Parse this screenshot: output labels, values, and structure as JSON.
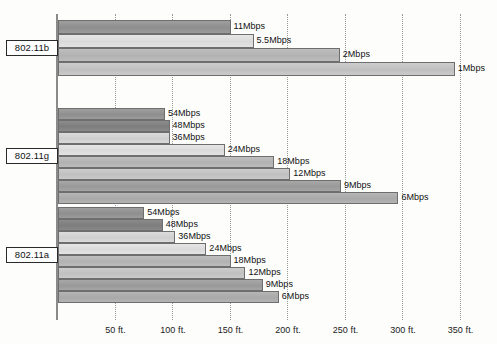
{
  "chart_data": {
    "type": "bar",
    "orientation": "horizontal",
    "title": "",
    "xlabel": "",
    "ylabel": "",
    "xlim": [
      0,
      370
    ],
    "x_unit": "ft.",
    "grid": "vertical-dotted",
    "legend": "none",
    "tick_labels": [
      "50 ft.",
      "100 ft.",
      "150 ft.",
      "200 ft.",
      "250 ft.",
      "300 ft.",
      "350 ft."
    ],
    "ticks": [
      50,
      100,
      150,
      200,
      250,
      300,
      350
    ],
    "groups": [
      {
        "name": "802.11b",
        "series": [
          {
            "label": "11Mbps",
            "value": 150,
            "shade": 0
          },
          {
            "label": "5.5Mbps",
            "value": 170,
            "shade": 3
          },
          {
            "label": "2Mbps",
            "value": 245,
            "shade": 4
          },
          {
            "label": "1Mbps",
            "value": 345,
            "shade": 5
          }
        ]
      },
      {
        "name": "802.11g",
        "series": [
          {
            "label": "54Mbps",
            "value": 93,
            "shade": 0
          },
          {
            "label": "48Mbps",
            "value": 97,
            "shade": 1
          },
          {
            "label": "36Mbps",
            "value": 97,
            "shade": 2
          },
          {
            "label": "24Mbps",
            "value": 145,
            "shade": 3
          },
          {
            "label": "18Mbps",
            "value": 188,
            "shade": 4
          },
          {
            "label": "12Mbps",
            "value": 202,
            "shade": 5
          },
          {
            "label": "9Mbps",
            "value": 246,
            "shade": 6
          },
          {
            "label": "6Mbps",
            "value": 296,
            "shade": 7
          }
        ]
      },
      {
        "name": "802.11a",
        "series": [
          {
            "label": "54Mbps",
            "value": 75,
            "shade": 0
          },
          {
            "label": "48Mbps",
            "value": 91,
            "shade": 1
          },
          {
            "label": "36Mbps",
            "value": 102,
            "shade": 2
          },
          {
            "label": "24Mbps",
            "value": 129,
            "shade": 3
          },
          {
            "label": "18Mbps",
            "value": 150,
            "shade": 4
          },
          {
            "label": "12Mbps",
            "value": 163,
            "shade": 5
          },
          {
            "label": "9Mbps",
            "value": 178,
            "shade": 6
          },
          {
            "label": "6Mbps",
            "value": 192,
            "shade": 7
          }
        ]
      }
    ]
  },
  "layout": {
    "axis_x_px": 58,
    "px_per_ft": 1.15,
    "groups": [
      {
        "top": 20,
        "bar_height": 13.5,
        "bar_gap": 0.5
      },
      {
        "top": 108,
        "bar_height": 11.6,
        "bar_gap": 0.4
      },
      {
        "top": 207,
        "bar_height": 11.6,
        "bar_gap": 0.4
      }
    ]
  }
}
